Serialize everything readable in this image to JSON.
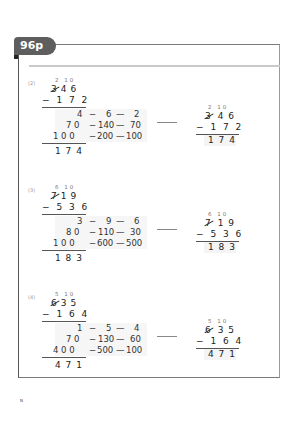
{
  "page": {
    "label": "96p"
  },
  "problems": [
    {
      "number": "(2)",
      "carry": "2 10",
      "minuend": "346",
      "minuend_struck_digit": "3",
      "minuend_rest": "46",
      "subtrahend_line": "− 1 7 2",
      "steps": [
        {
          "a": "4",
          "b": "6",
          "c": "2"
        },
        {
          "a": "7 0",
          "b": "140",
          "c": "70"
        },
        {
          "a": "1 0 0",
          "b": "200",
          "c": "100"
        }
      ],
      "answer": "1 7 4",
      "final": {
        "carry": "2 10",
        "struck": "3",
        "rest": "4 6",
        "subtrahend": "− 1 7 2",
        "answer": "1 7 4"
      }
    },
    {
      "number": "(3)",
      "carry": "6 10",
      "minuend": "719",
      "minuend_struck_digit": "7",
      "minuend_rest": "19",
      "subtrahend_line": "− 5 3 6",
      "steps": [
        {
          "a": "3",
          "b": "9",
          "c": "6"
        },
        {
          "a": "8 0",
          "b": "110",
          "c": "30"
        },
        {
          "a": "1 0 0",
          "b": "600",
          "c": "500"
        }
      ],
      "answer": "1 8 3",
      "final": {
        "carry": "6 10",
        "struck": "7",
        "rest": "1 9",
        "subtrahend": "− 5 3 6",
        "answer": "1 8 3"
      }
    },
    {
      "number": "(4)",
      "carry": "5 10",
      "minuend": "635",
      "minuend_struck_digit": "6",
      "minuend_rest": "35",
      "subtrahend_line": "− 1 6 4",
      "steps": [
        {
          "a": "1",
          "b": "5",
          "c": "4"
        },
        {
          "a": "7 0",
          "b": "130",
          "c": "60"
        },
        {
          "a": "4 0 0",
          "b": "500",
          "c": "100"
        }
      ],
      "answer": "4 7 1",
      "final": {
        "carry": "5 10",
        "struck": "6",
        "rest": "3 5",
        "subtrahend": "− 1 6 4",
        "answer": "4 7 1"
      }
    }
  ],
  "symbols": {
    "minus": "−",
    "dash": "—"
  },
  "footer": {
    "mark": "N"
  }
}
